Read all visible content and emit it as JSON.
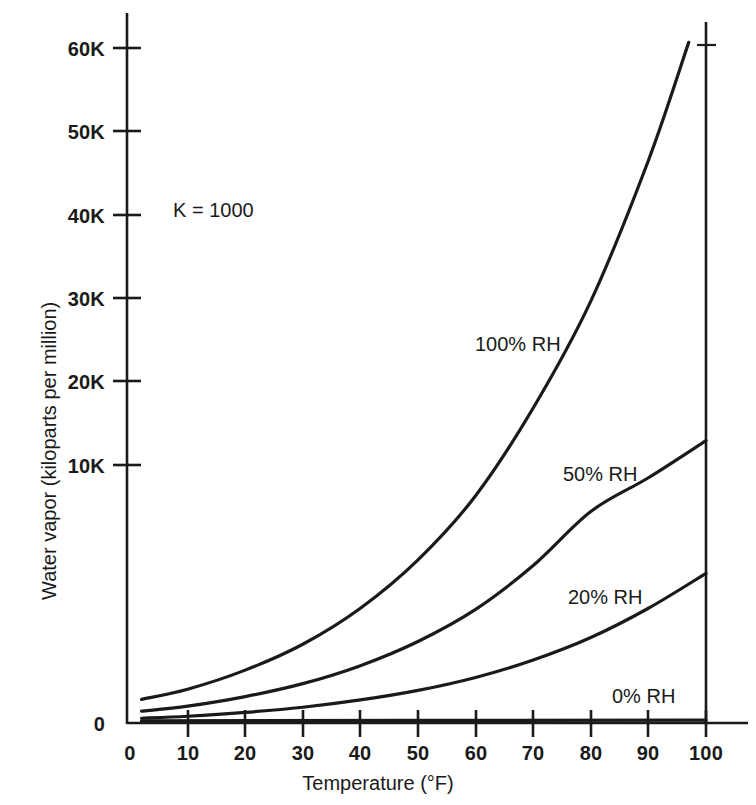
{
  "chart_data": {
    "type": "line",
    "title": "",
    "xlabel": "Temperature (°F)",
    "ylabel": "Water vapor (kiloparts per million)",
    "xlim": [
      0,
      100
    ],
    "ylim": [
      0,
      63000
    ],
    "xticks": [
      0,
      10,
      20,
      30,
      40,
      50,
      60,
      70,
      80,
      90,
      100
    ],
    "xticklabels": [
      "0",
      "10",
      "20",
      "30",
      "40",
      "50",
      "60",
      "70",
      "80",
      "90",
      "100"
    ],
    "yticks": [
      0,
      10000,
      20000,
      30000,
      40000,
      50000,
      60000
    ],
    "yticklabels": [
      "0",
      "10K",
      "20K",
      "30K",
      "40K",
      "50K",
      "60K"
    ],
    "grid": false,
    "legend_position": "inline-curve-labels",
    "annotations": [
      {
        "text": "K = 1000",
        "x": 12,
        "y": 45000
      }
    ],
    "series": [
      {
        "name": "100% RH",
        "label": "100% RH",
        "color": "#1a1a1a",
        "x": [
          2,
          10,
          20,
          30,
          40,
          50,
          60,
          70,
          80,
          90,
          97
        ],
        "values": [
          2100,
          3000,
          4700,
          7000,
          10200,
          14500,
          20200,
          28000,
          37500,
          50000,
          60500
        ]
      },
      {
        "name": "50% RH",
        "label": "50% RH",
        "color": "#1a1a1a",
        "x": [
          2,
          10,
          20,
          30,
          40,
          50,
          60,
          70,
          80,
          90,
          100
        ],
        "values": [
          1050,
          1500,
          2350,
          3500,
          5100,
          7250,
          10100,
          14000,
          18800,
          21800,
          25100
        ]
      },
      {
        "name": "20% RH",
        "label": "20% RH",
        "color": "#1a1a1a",
        "x": [
          2,
          10,
          20,
          30,
          40,
          50,
          60,
          70,
          80,
          90,
          100
        ],
        "values": [
          420,
          600,
          940,
          1400,
          2050,
          2900,
          4050,
          5600,
          7600,
          10200,
          13300
        ]
      },
      {
        "name": "0% RH",
        "label": "0% RH",
        "color": "#1a1a1a",
        "x": [
          2,
          100
        ],
        "values": [
          200,
          250
        ]
      }
    ],
    "series_label_positions": [
      {
        "name": "100% RH",
        "left": 475,
        "top": 333
      },
      {
        "name": "50% RH",
        "left": 563,
        "top": 463
      },
      {
        "name": "20% RH",
        "left": 568,
        "top": 586
      },
      {
        "name": "0% RH",
        "left": 612,
        "top": 685
      }
    ]
  },
  "axes": {
    "y_tick_rows": [
      {
        "label": "60K",
        "top": 38
      },
      {
        "label": "50K",
        "top": 121
      },
      {
        "label": "40K",
        "top": 205
      },
      {
        "label": "30K",
        "top": 288
      },
      {
        "label": "20K",
        "top": 371
      },
      {
        "label": "10K",
        "top": 455
      },
      {
        "label": "0",
        "top": 713
      }
    ],
    "x_tick_cols": [
      {
        "label": "0",
        "left": 130
      },
      {
        "label": "10",
        "left": 188
      },
      {
        "label": "20",
        "left": 245
      },
      {
        "label": "30",
        "left": 303
      },
      {
        "label": "40",
        "left": 360
      },
      {
        "label": "50",
        "left": 418
      },
      {
        "label": "60",
        "left": 476
      },
      {
        "label": "70",
        "left": 533
      },
      {
        "label": "80",
        "left": 591
      },
      {
        "label": "90",
        "left": 648
      },
      {
        "label": "100",
        "left": 706
      }
    ]
  }
}
